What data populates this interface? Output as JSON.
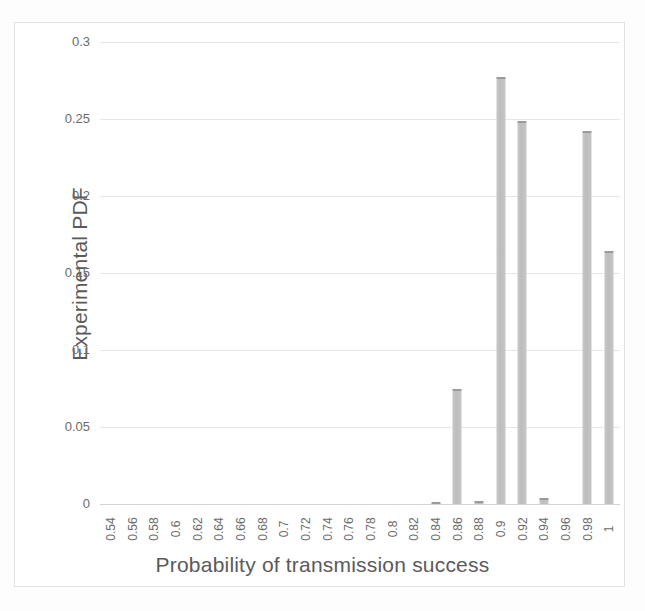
{
  "chart_data": {
    "type": "bar",
    "title": "",
    "xlabel": "Probability of transmission success",
    "ylabel": "Experimental PDF",
    "categories": [
      "0.54",
      "0.56",
      "0.58",
      "0.6",
      "0.62",
      "0.64",
      "0.66",
      "0.68",
      "0.7",
      "0.72",
      "0.74",
      "0.76",
      "0.78",
      "0.8",
      "0.82",
      "0.84",
      "0.86",
      "0.88",
      "0.9",
      "0.92",
      "0.94",
      "0.96",
      "0.98",
      "1"
    ],
    "values": [
      0,
      0,
      0,
      0,
      0,
      0,
      0,
      0,
      0,
      0,
      0,
      0,
      0,
      0,
      0,
      0.0008,
      0.075,
      0.002,
      0.277,
      0.249,
      0.004,
      0,
      0.242,
      0.164
    ],
    "ylim": [
      0,
      0.3
    ],
    "ytick_labels": [
      "0",
      "0.05",
      "0.1",
      "0.15",
      "0.2",
      "0.25",
      "0.3"
    ],
    "ytick_values": [
      0,
      0.05,
      0.1,
      0.15,
      0.2,
      0.25,
      0.3
    ],
    "grid": true,
    "legend": "none",
    "bar_color": "#c0c0c0",
    "bar_edge_color": "#9a9a9a",
    "text_color": "#5a5a5a",
    "gridline_color": "#e6e6e6",
    "background_color": "#ffffff"
  }
}
